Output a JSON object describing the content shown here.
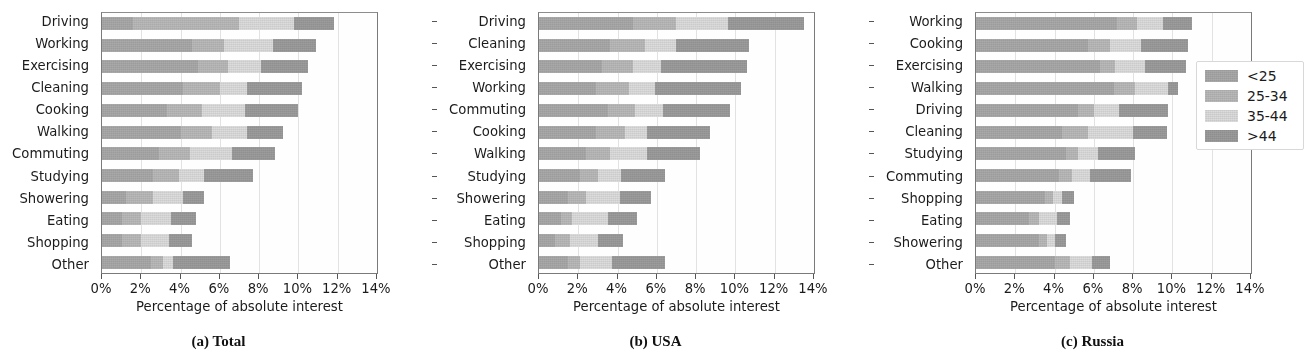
{
  "figure": {
    "xaxis_title": "Percentage of absolute interest",
    "xticklabels": [
      "0%",
      "2%",
      "4%",
      "6%",
      "8%",
      "10%",
      "12%",
      "14%"
    ],
    "xticks": [
      0,
      2,
      4,
      6,
      8,
      10,
      12,
      14
    ],
    "xlim": [
      0,
      14
    ],
    "captions": [
      "(a) Total",
      "(b) USA",
      "(c) Russia"
    ]
  },
  "legend": {
    "position": "right",
    "entries": [
      {
        "label": "<25",
        "color": "#a9a9a9"
      },
      {
        "label": "25-34",
        "color": "#b9b9b9"
      },
      {
        "label": "35-44",
        "color": "#dcdcdc"
      },
      {
        "label": ">44",
        "color": "#9c9c9c"
      }
    ]
  },
  "colors": {
    "seg_lt25": "#a9a9a9",
    "seg_25_34": "#b9b9b9",
    "seg_35_44": "#dcdcdc",
    "seg_gt44": "#9c9c9c",
    "axis": "#7a7a7a",
    "grid": "#e2e2e2",
    "text": "#1b1b1b"
  },
  "chart_data": [
    {
      "type": "bar",
      "orientation": "horizontal",
      "stacked": true,
      "title": "(a) Total",
      "xlabel": "Percentage of absolute interest",
      "ylabel": "",
      "xlim": [
        0,
        14
      ],
      "grid": true,
      "legend_position": "right",
      "categories": [
        "Driving",
        "Working",
        "Exercising",
        "Cleaning",
        "Cooking",
        "Walking",
        "Commuting",
        "Studying",
        "Showering",
        "Eating",
        "Shopping",
        "Other"
      ],
      "series": [
        {
          "name": "<25",
          "values": [
            1.6,
            4.6,
            4.9,
            4.1,
            3.3,
            4.0,
            2.9,
            2.6,
            1.2,
            1.0,
            1.0,
            2.5
          ]
        },
        {
          "name": "25-34",
          "values": [
            5.4,
            1.6,
            1.5,
            1.9,
            1.8,
            1.6,
            1.6,
            1.3,
            1.4,
            1.0,
            1.0,
            0.6
          ]
        },
        {
          "name": "35-44",
          "values": [
            2.8,
            2.5,
            1.7,
            1.4,
            2.2,
            1.8,
            2.1,
            1.3,
            1.5,
            1.5,
            1.4,
            0.5
          ]
        },
        {
          "name": ">44",
          "values": [
            2.0,
            2.2,
            2.4,
            2.8,
            2.7,
            1.8,
            2.2,
            2.5,
            1.1,
            1.3,
            1.2,
            2.9
          ]
        }
      ],
      "totals": [
        11.8,
        10.9,
        10.5,
        10.2,
        10.0,
        9.2,
        8.8,
        7.7,
        5.2,
        4.8,
        4.6,
        6.5
      ]
    },
    {
      "type": "bar",
      "orientation": "horizontal",
      "stacked": true,
      "title": "(b) USA",
      "xlabel": "Percentage of absolute interest",
      "ylabel": "",
      "xlim": [
        0,
        14
      ],
      "grid": true,
      "legend_position": "right",
      "categories": [
        "Driving",
        "Cleaning",
        "Exercising",
        "Working",
        "Commuting",
        "Cooking",
        "Walking",
        "Studying",
        "Showering",
        "Eating",
        "Shopping",
        "Other"
      ],
      "series": [
        {
          "name": "<25",
          "values": [
            4.8,
            3.6,
            3.2,
            2.9,
            3.5,
            2.9,
            2.4,
            2.1,
            1.5,
            1.1,
            0.8,
            1.5
          ]
        },
        {
          "name": "25-34",
          "values": [
            2.2,
            1.8,
            1.6,
            1.7,
            1.4,
            1.5,
            1.2,
            0.9,
            0.9,
            0.6,
            0.8,
            0.6
          ]
        },
        {
          "name": "35-44",
          "values": [
            2.6,
            1.6,
            1.4,
            1.3,
            1.4,
            1.1,
            1.9,
            1.2,
            1.7,
            1.8,
            1.4,
            1.6
          ]
        },
        {
          "name": ">44",
          "values": [
            3.9,
            3.7,
            4.4,
            4.4,
            3.4,
            3.2,
            2.7,
            2.2,
            1.6,
            1.5,
            1.3,
            2.7
          ]
        }
      ],
      "totals": [
        13.5,
        10.7,
        10.6,
        10.3,
        9.7,
        8.7,
        8.2,
        6.4,
        5.7,
        5.0,
        4.3,
        6.4
      ]
    },
    {
      "type": "bar",
      "orientation": "horizontal",
      "stacked": true,
      "title": "(c) Russia",
      "xlabel": "Percentage of absolute interest",
      "ylabel": "",
      "xlim": [
        0,
        14
      ],
      "grid": true,
      "legend_position": "right",
      "categories": [
        "Working",
        "Cooking",
        "Exercising",
        "Walking",
        "Driving",
        "Cleaning",
        "Studying",
        "Commuting",
        "Shopping",
        "Eating",
        "Showering",
        "Other"
      ],
      "series": [
        {
          "name": "<25",
          "values": [
            7.2,
            5.7,
            6.3,
            7.0,
            5.2,
            4.4,
            4.6,
            4.2,
            3.5,
            2.7,
            3.2,
            4.0
          ]
        },
        {
          "name": "25-34",
          "values": [
            1.0,
            1.1,
            0.8,
            1.1,
            0.8,
            1.3,
            0.6,
            0.7,
            0.4,
            0.5,
            0.4,
            0.8
          ]
        },
        {
          "name": "35-44",
          "values": [
            1.3,
            1.6,
            1.5,
            1.7,
            1.3,
            2.3,
            1.0,
            0.9,
            0.5,
            0.9,
            0.4,
            1.1
          ]
        },
        {
          "name": ">44",
          "values": [
            1.5,
            2.4,
            2.1,
            0.5,
            2.5,
            1.7,
            1.9,
            2.1,
            0.6,
            0.7,
            0.6,
            0.9
          ]
        }
      ],
      "totals": [
        11.0,
        10.8,
        10.7,
        10.3,
        9.8,
        9.7,
        8.1,
        7.9,
        5.0,
        4.8,
        4.6,
        6.8
      ]
    }
  ]
}
